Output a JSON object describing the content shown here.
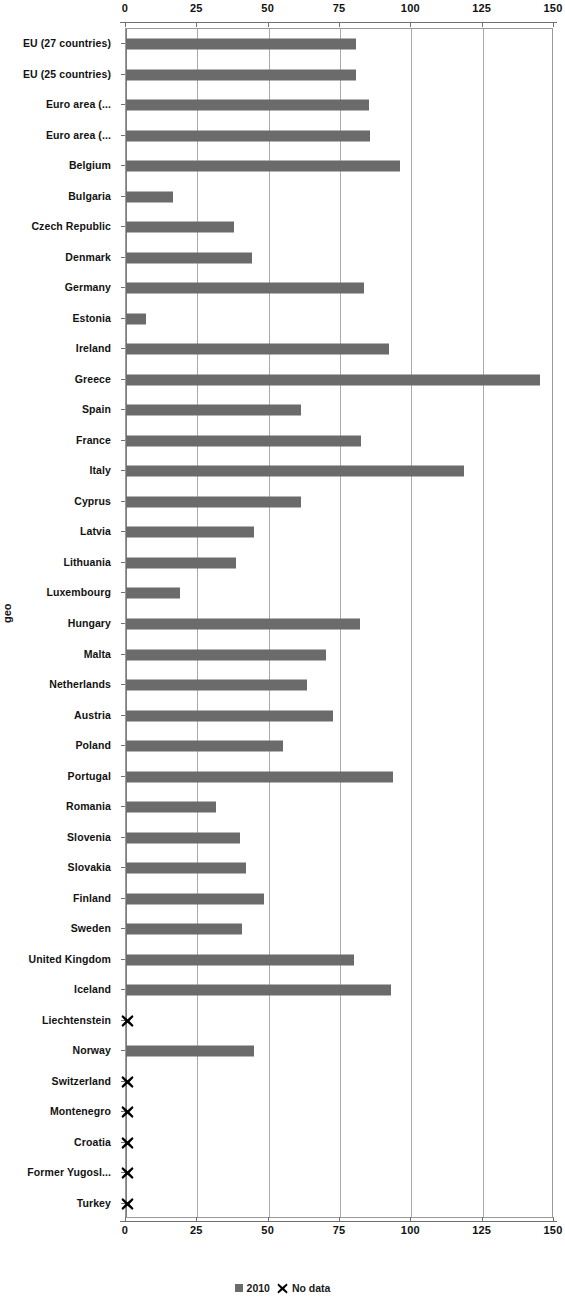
{
  "chart_data": {
    "type": "bar",
    "orientation": "horizontal",
    "title": "",
    "xlabel": "",
    "ylabel": "geo",
    "xlim": [
      0,
      150
    ],
    "xticks": [
      0,
      25,
      50,
      75,
      100,
      125,
      150
    ],
    "grid": true,
    "legend_position": "bottom",
    "series_name": "2010",
    "no_data_label": "No data",
    "bar_color": "#6b6b6b",
    "no_data_marker_color": "#000000",
    "categories": [
      "EU (27 countries)",
      "EU (25 countries)",
      "Euro area (...",
      "Euro area (...",
      "Belgium",
      "Bulgaria",
      "Czech Republic",
      "Denmark",
      "Germany",
      "Estonia",
      "Ireland",
      "Greece",
      "Spain",
      "France",
      "Italy",
      "Cyprus",
      "Latvia",
      "Lithuania",
      "Luxembourg",
      "Hungary",
      "Malta",
      "Netherlands",
      "Austria",
      "Poland",
      "Portugal",
      "Romania",
      "Slovenia",
      "Slovakia",
      "Finland",
      "Sweden",
      "United Kingdom",
      "Iceland",
      "Liechtenstein",
      "Norway",
      "Switzerland",
      "Montenegro",
      "Croatia",
      "Former Yugosl...",
      "Turkey"
    ],
    "values": [
      80.5,
      80.5,
      85.0,
      85.5,
      96.0,
      16.5,
      38.0,
      44.0,
      83.5,
      7.0,
      92.0,
      145.0,
      61.5,
      82.5,
      118.5,
      61.5,
      45.0,
      38.5,
      19.0,
      82.0,
      70.0,
      63.5,
      72.5,
      55.0,
      93.5,
      31.5,
      40.0,
      42.0,
      48.5,
      40.5,
      80.0,
      93.0,
      null,
      45.0,
      null,
      null,
      null,
      null,
      null
    ],
    "no_data_categories": [
      "Liechtenstein",
      "Switzerland",
      "Montenegro",
      "Croatia",
      "Former Yugosl...",
      "Turkey"
    ]
  },
  "legend": {
    "series_label": "2010",
    "no_data_label": "No data"
  },
  "axis": {
    "y_title": "geo"
  }
}
